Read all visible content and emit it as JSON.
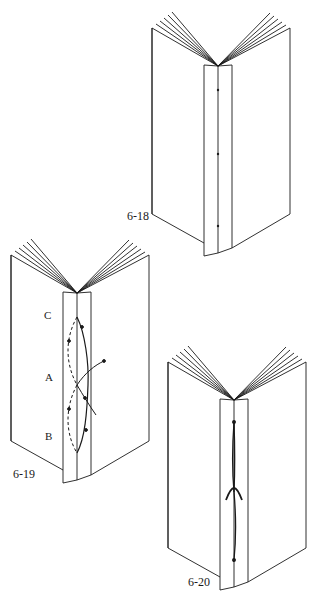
{
  "figures": [
    {
      "id": "6-18",
      "label": "6-18",
      "description": "Open book viewed from spine with three sewing stations marked on spine fold"
    },
    {
      "id": "6-19",
      "label": "6-19",
      "description": "Open book showing sewing path through stations C, A, B with solid (outside) and dashed (inside) thread paths",
      "stations": [
        {
          "name": "C",
          "label": "C"
        },
        {
          "name": "A",
          "label": "A"
        },
        {
          "name": "B",
          "label": "B"
        }
      ]
    },
    {
      "id": "6-20",
      "label": "6-20",
      "description": "Open book showing finished pamphlet stitch with thread tied at center station"
    }
  ],
  "colors": {
    "line": "#1a1a1a",
    "background": "#ffffff"
  }
}
